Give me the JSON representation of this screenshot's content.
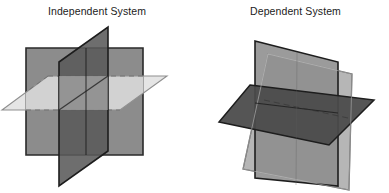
{
  "page": {
    "background_color": "#ffffff",
    "width": 389,
    "height": 193
  },
  "figures": [
    {
      "id": "independent-system",
      "caption": "Independent System",
      "caption_color": "#1b1b1b",
      "planes": [
        {
          "name": "back-vertical-square",
          "role": "plane-1",
          "fill": "#8c8c8c",
          "stroke": "#2a2a2a",
          "points": "26,48 143,48 143,155 26,155"
        },
        {
          "name": "front-vertical-parallelogram",
          "role": "plane-2",
          "fill": "#5a5a5a",
          "stroke": "#1d1d1d",
          "points": "108,27 108,151 59,186 59,62"
        },
        {
          "name": "horizontal-parallelogram",
          "role": "plane-3",
          "fill": "#d5d5d5",
          "stroke": "#8a8a8a",
          "points": "48,76 167,76 120,110 2,110"
        }
      ]
    },
    {
      "id": "dependent-system",
      "caption": "Dependent System",
      "caption_color": "#1b1b1b",
      "planes": [
        {
          "name": "back-tilted-vertical-plane",
          "role": "plane-1",
          "fill": "#9a9a9a",
          "stroke": "#3a3a3a",
          "points": "268,54 352,74 349,190 243,169"
        },
        {
          "name": "front-vertical-plane",
          "role": "plane-2",
          "fill": "#8a8a8a",
          "stroke": "#1d1d1d",
          "points": "255,41 338,62 338,186 255,178"
        },
        {
          "name": "dark-horizontal-plane",
          "role": "plane-3",
          "fill": "#4a4a4a",
          "stroke": "#1d1d1d",
          "points": "250,85 374,100 329,145 219,122"
        }
      ]
    }
  ],
  "colors": {
    "light_gray": "#d5d5d5",
    "mid_gray": "#8c8c8c",
    "dark_gray": "#5a5a5a",
    "darkest_gray": "#4a4a4a",
    "outline": "#1d1d1d",
    "text": "#1b1b1b"
  }
}
